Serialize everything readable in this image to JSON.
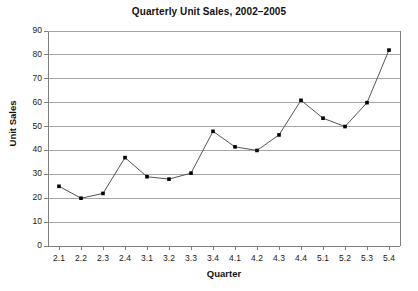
{
  "chart_data": {
    "type": "line",
    "title": "Quarterly Unit Sales, 2002–2005",
    "xlabel": "Quarter",
    "ylabel": "Unit Sales",
    "categories": [
      "2.1",
      "2.2",
      "2.3",
      "2.4",
      "3.1",
      "3.2",
      "3.3",
      "3.4",
      "4.1",
      "4.2",
      "4.3",
      "4.4",
      "5.1",
      "5.2",
      "5.3",
      "5.4"
    ],
    "values": [
      25,
      20,
      22,
      37,
      29,
      28,
      30.5,
      48,
      41.5,
      40,
      46.5,
      61,
      53.5,
      50,
      60,
      82
    ],
    "series": [
      {
        "name": "Unit Sales",
        "values": [
          25,
          20,
          22,
          37,
          29,
          28,
          30.5,
          48,
          41.5,
          40,
          46.5,
          61,
          53.5,
          50,
          60,
          82
        ]
      }
    ],
    "ylim": [
      0,
      90
    ],
    "ytick_labels": [
      "0",
      "10",
      "20",
      "30",
      "40",
      "50",
      "60",
      "70",
      "80",
      "90"
    ],
    "ytick_values": [
      0,
      10,
      20,
      30,
      40,
      50,
      60,
      70,
      80,
      90
    ],
    "grid": true,
    "grid_axis": "y",
    "legend": false,
    "legend_position": "none",
    "marker": "square",
    "line_color": "#555555",
    "marker_color": "#000000",
    "grid_color": "#a6a6a6",
    "axis_color": "#808080",
    "background_color": "#ffffff"
  }
}
